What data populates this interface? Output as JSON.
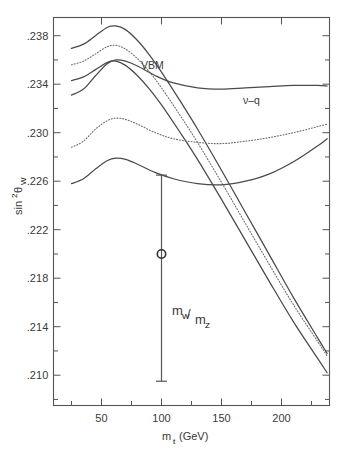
{
  "figure": {
    "ylabel": "sin",
    "ylabel_sup": "2",
    "ylabel_theta": "θ",
    "ylabel_sub": "W",
    "xlabel": "m",
    "xlabel_sub": "t",
    "xlabel_unit": "(GeV)"
  },
  "annotations": {
    "vbm": "VBM",
    "nuq": "ν–q",
    "mwmz_num": "m",
    "mwmz_num_sub": "W",
    "mwmz_slash": "/",
    "mwmz_den": "m",
    "mwmz_den_sub": "Z"
  },
  "chart_data": {
    "type": "line",
    "title": "",
    "xlabel": "m_t (GeV)",
    "ylabel": "sin^2 θ_W",
    "xlim": [
      10,
      240
    ],
    "ylim": [
      0.2075,
      0.2395
    ],
    "xticks": [
      50,
      100,
      150,
      200
    ],
    "xtick_labels": [
      "50",
      "100",
      "150",
      "200"
    ],
    "xtick_minor_step": 25,
    "yticks": [
      0.238,
      0.234,
      0.23,
      0.226,
      0.222,
      0.218,
      0.214,
      0.21
    ],
    "ytick_labels": [
      ".238",
      ".234",
      ".230",
      ".226",
      ".222",
      ".218",
      ".214",
      ".210"
    ],
    "ytick_minor_step": 0.002,
    "grid": false,
    "legend_position": "inline-annotations",
    "series": [
      {
        "name": "VBM upper (solid)",
        "style": "solid",
        "group": "VBM",
        "x": [
          25,
          35,
          45,
          55,
          62,
          70,
          80,
          90,
          100,
          115,
          130,
          150,
          170,
          190,
          210,
          230,
          238
        ],
        "values": [
          0.23695,
          0.2373,
          0.238,
          0.2387,
          0.2388,
          0.2385,
          0.2376,
          0.2364,
          0.235,
          0.2327,
          0.2303,
          0.2269,
          0.2234,
          0.2199,
          0.2164,
          0.2131,
          0.2118
        ]
      },
      {
        "name": "VBM middle (dotted)",
        "style": "dotted",
        "group": "VBM",
        "x": [
          25,
          35,
          45,
          55,
          62,
          70,
          80,
          90,
          100,
          115,
          130,
          150,
          170,
          190,
          210,
          230,
          238
        ],
        "values": [
          0.2356,
          0.2359,
          0.2365,
          0.2371,
          0.2372,
          0.2369,
          0.2361,
          0.235,
          0.2337,
          0.2315,
          0.2292,
          0.2259,
          0.2225,
          0.2191,
          0.2158,
          0.2128,
          0.2116
        ]
      },
      {
        "name": "VBM lower (solid)",
        "style": "solid",
        "group": "VBM",
        "x": [
          25,
          35,
          45,
          55,
          62,
          70,
          80,
          90,
          100,
          115,
          130,
          150,
          170,
          190,
          210,
          230,
          238
        ],
        "values": [
          0.2343,
          0.2346,
          0.2352,
          0.2358,
          0.2359,
          0.23555,
          0.2347,
          0.2336,
          0.2323,
          0.2301,
          0.2278,
          0.2245,
          0.2211,
          0.2177,
          0.2144,
          0.2114,
          0.2102
        ]
      },
      {
        "name": "nu-q upper (solid)",
        "style": "solid",
        "group": "nu-q",
        "x": [
          25,
          35,
          45,
          55,
          62,
          70,
          80,
          95,
          110,
          130,
          150,
          170,
          190,
          210,
          230,
          238
        ],
        "values": [
          0.2331,
          0.2336,
          0.2347,
          0.2357,
          0.236,
          0.2359,
          0.2355,
          0.2347,
          0.2341,
          0.2337,
          0.2336,
          0.2337,
          0.2338,
          0.2339,
          0.2339,
          0.23385
        ]
      },
      {
        "name": "nu-q middle (dotted)",
        "style": "dotted",
        "group": "nu-q",
        "x": [
          25,
          35,
          45,
          55,
          62,
          70,
          80,
          95,
          110,
          130,
          150,
          170,
          190,
          210,
          230,
          238
        ],
        "values": [
          0.2288,
          0.2293,
          0.2303,
          0.231,
          0.2312,
          0.2311,
          0.2307,
          0.23,
          0.2295,
          0.2292,
          0.2291,
          0.2293,
          0.2296,
          0.23,
          0.2305,
          0.2307
        ]
      },
      {
        "name": "nu-q lower (solid)",
        "style": "solid",
        "group": "nu-q",
        "x": [
          25,
          35,
          45,
          55,
          62,
          70,
          80,
          95,
          110,
          130,
          150,
          170,
          190,
          210,
          230,
          238
        ],
        "values": [
          0.2258,
          0.2262,
          0.227,
          0.2277,
          0.2279,
          0.2278,
          0.2274,
          0.2267,
          0.2262,
          0.2258,
          0.2257,
          0.226,
          0.2266,
          0.2276,
          0.2289,
          0.2295
        ]
      }
    ],
    "datapoints": [
      {
        "name": "m_W/m_Z measurement",
        "x": 100,
        "y": 0.22,
        "yerr_low": 0.2095,
        "yerr_high": 0.2265,
        "marker": "open-circle"
      }
    ]
  }
}
